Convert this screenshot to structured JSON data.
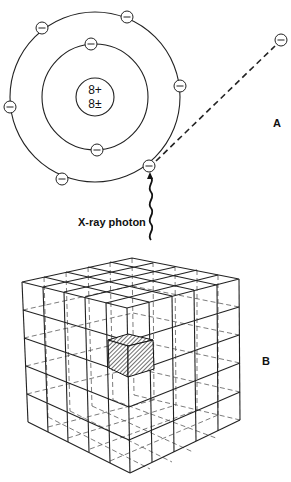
{
  "figure": {
    "panel_a": {
      "label": "A",
      "nucleus": {
        "protons": "8+",
        "neutrons": "8±"
      },
      "inner_shell_electrons": 2,
      "outer_shell_electrons": 6,
      "ejected_electron_symbol": "−",
      "photon_label": "X-ray photon"
    },
    "panel_b": {
      "label": "B",
      "grid": "5×5×5 cube of voxels",
      "highlighted_voxel": "hatched"
    }
  }
}
